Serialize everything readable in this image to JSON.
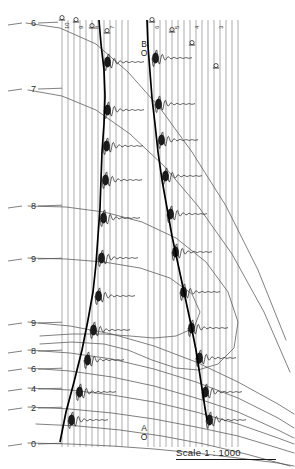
{
  "figure": {
    "kind": "seismic-refraction-record-section",
    "width": 295,
    "height": 469,
    "background": "#ffffff",
    "ink": "#1b1b1b",
    "grid_color": "#555555",
    "trace_color": "#8a8a8a"
  },
  "scale": {
    "label": "Scale",
    "value": "1 : 1000",
    "full": "Scale   1 : 1000"
  },
  "shotpoints": [
    {
      "name": "shotpoint-B",
      "letter": "B",
      "symbol": "O",
      "x": 137,
      "y": 40
    },
    {
      "name": "shotpoint-A",
      "letter": "A",
      "symbol": "O",
      "x": 137,
      "y": 424
    }
  ],
  "left_axis": {
    "name": "time-depth-axis",
    "labels": [
      {
        "text": "6",
        "y": 22,
        "leader_x2": 58
      },
      {
        "text": "7",
        "y": 88,
        "leader_x2": 62
      },
      {
        "text": "8",
        "y": 205,
        "leader_x2": 62
      },
      {
        "text": "9",
        "y": 258,
        "leader_x2": 62
      },
      {
        "text": "9",
        "y": 322,
        "leader_x2": 62
      },
      {
        "text": "8",
        "y": 350,
        "leader_x2": 62
      },
      {
        "text": "6",
        "y": 368,
        "leader_x2": 62
      },
      {
        "text": "4",
        "y": 388,
        "leader_x2": 62
      },
      {
        "text": "2",
        "y": 407,
        "leader_x2": 62
      },
      {
        "text": "0",
        "y": 443,
        "leader_x2": 62
      }
    ]
  },
  "top_labels": [
    {
      "text": "10",
      "x": 62,
      "y": 29
    },
    {
      "text": "9",
      "x": 76,
      "y": 29
    },
    {
      "text": "8",
      "x": 92,
      "y": 29
    },
    {
      "text": "7",
      "x": 107,
      "y": 29
    },
    {
      "text": "6",
      "x": 152,
      "y": 29
    },
    {
      "text": "5",
      "x": 172,
      "y": 29
    },
    {
      "text": "4",
      "x": 192,
      "y": 29
    },
    {
      "text": "3",
      "x": 216,
      "y": 29
    }
  ],
  "chart_data": {
    "type": "line",
    "title": "",
    "xlabel": "",
    "ylabel": "",
    "traces_group_left": {
      "x_positions": [
        62,
        68,
        74,
        80,
        86,
        92,
        98,
        104,
        110,
        116,
        122,
        128
      ],
      "top_y": 20,
      "bottom_y": 447
    },
    "traces_group_right": {
      "x_positions": [
        148,
        154,
        160,
        166,
        172,
        178,
        184,
        190,
        196,
        202,
        208,
        214,
        220,
        226,
        232,
        238
      ],
      "top_y": 20,
      "bottom_y": 447
    },
    "trace_top_caps": [
      {
        "x": 62,
        "y": 20
      },
      {
        "x": 76,
        "y": 22
      },
      {
        "x": 92,
        "y": 28
      },
      {
        "x": 107,
        "y": 33
      },
      {
        "x": 152,
        "y": 22
      },
      {
        "x": 172,
        "y": 32
      },
      {
        "x": 192,
        "y": 45
      },
      {
        "x": 216,
        "y": 68
      }
    ],
    "pick_curve_left": [
      [
        99,
        20
      ],
      [
        101,
        44
      ],
      [
        104,
        70
      ],
      [
        105,
        96
      ],
      [
        104,
        124
      ],
      [
        102,
        152
      ],
      [
        101,
        180
      ],
      [
        100,
        208
      ],
      [
        98,
        236
      ],
      [
        96,
        264
      ],
      [
        93,
        292
      ],
      [
        88,
        320
      ],
      [
        82,
        350
      ],
      [
        74,
        382
      ],
      [
        66,
        412
      ],
      [
        60,
        442
      ]
    ],
    "pick_curve_right": [
      [
        147,
        20
      ],
      [
        148,
        46
      ],
      [
        150,
        72
      ],
      [
        152,
        98
      ],
      [
        155,
        124
      ],
      [
        158,
        152
      ],
      [
        162,
        180
      ],
      [
        167,
        208
      ],
      [
        172,
        236
      ],
      [
        178,
        264
      ],
      [
        184,
        292
      ],
      [
        190,
        320
      ],
      [
        196,
        350
      ],
      [
        201,
        382
      ],
      [
        205,
        408
      ],
      [
        207,
        420
      ]
    ],
    "travel_time_curves": [
      {
        "name": "curve-6",
        "points": [
          [
            26,
            23
          ],
          [
            60,
            28
          ],
          [
            96,
            44
          ],
          [
            128,
            72
          ],
          [
            160,
            108
          ],
          [
            192,
            152
          ],
          [
            226,
            206
          ],
          [
            258,
            270
          ],
          [
            286,
            340
          ]
        ]
      },
      {
        "name": "curve-7",
        "points": [
          [
            28,
            90
          ],
          [
            62,
            96
          ],
          [
            96,
            110
          ],
          [
            130,
            134
          ],
          [
            164,
            166
          ],
          [
            198,
            206
          ],
          [
            232,
            254
          ],
          [
            264,
            312
          ],
          [
            290,
            372
          ]
        ]
      },
      {
        "name": "curve-8",
        "points": [
          [
            28,
            206
          ],
          [
            66,
            207
          ],
          [
            104,
            212
          ],
          [
            142,
            222
          ],
          [
            176,
            238
          ],
          [
            206,
            262
          ],
          [
            228,
            292
          ],
          [
            238,
            322
          ],
          [
            234,
            348
          ],
          [
            218,
            364
          ],
          [
            198,
            370
          ],
          [
            176,
            368
          ],
          [
            152,
            360
          ],
          [
            128,
            350
          ],
          [
            104,
            344
          ],
          [
            72,
            342
          ],
          [
            40,
            344
          ]
        ]
      },
      {
        "name": "curve-9a",
        "points": [
          [
            28,
            258
          ],
          [
            66,
            259
          ],
          [
            104,
            262
          ],
          [
            140,
            268
          ],
          [
            170,
            278
          ],
          [
            192,
            294
          ],
          [
            200,
            312
          ],
          [
            194,
            328
          ],
          [
            176,
            336
          ],
          [
            154,
            338
          ],
          [
            130,
            336
          ],
          [
            104,
            334
          ],
          [
            72,
            334
          ],
          [
            40,
            336
          ]
        ]
      },
      {
        "name": "curve-9b",
        "points": [
          [
            28,
            322
          ],
          [
            70,
            326
          ],
          [
            112,
            334
          ],
          [
            154,
            346
          ],
          [
            196,
            362
          ],
          [
            238,
            382
          ],
          [
            278,
            404
          ],
          [
            294,
            414
          ]
        ]
      },
      {
        "name": "curve-8b",
        "points": [
          [
            28,
            350
          ],
          [
            70,
            353
          ],
          [
            112,
            359
          ],
          [
            154,
            369
          ],
          [
            196,
            382
          ],
          [
            238,
            398
          ],
          [
            278,
            418
          ],
          [
            294,
            428
          ]
        ]
      },
      {
        "name": "curve-6b",
        "points": [
          [
            28,
            368
          ],
          [
            70,
            371
          ],
          [
            112,
            377
          ],
          [
            154,
            386
          ],
          [
            196,
            398
          ],
          [
            238,
            412
          ],
          [
            278,
            430
          ],
          [
            294,
            438
          ]
        ]
      },
      {
        "name": "curve-4",
        "points": [
          [
            28,
            388
          ],
          [
            70,
            390
          ],
          [
            112,
            395
          ],
          [
            154,
            402
          ],
          [
            196,
            412
          ],
          [
            238,
            424
          ],
          [
            278,
            438
          ],
          [
            294,
            444
          ]
        ]
      },
      {
        "name": "curve-2",
        "points": [
          [
            28,
            407
          ],
          [
            70,
            409
          ],
          [
            112,
            413
          ],
          [
            154,
            419
          ],
          [
            196,
            427
          ],
          [
            238,
            436
          ],
          [
            278,
            448
          ],
          [
            294,
            453
          ]
        ]
      },
      {
        "name": "curve-0",
        "points": [
          [
            28,
            443
          ],
          [
            70,
            444
          ],
          [
            112,
            446
          ],
          [
            154,
            449
          ],
          [
            196,
            453
          ],
          [
            238,
            458
          ],
          [
            278,
            463
          ],
          [
            294,
            466
          ]
        ]
      },
      {
        "name": "curve-extra-1",
        "points": [
          [
            36,
            424
          ],
          [
            78,
            426
          ],
          [
            120,
            430
          ],
          [
            162,
            436
          ],
          [
            204,
            444
          ],
          [
            246,
            454
          ],
          [
            290,
            466
          ]
        ]
      }
    ],
    "wiggle_bursts_left": [
      {
        "x": 104,
        "y": 62
      },
      {
        "x": 104,
        "y": 110
      },
      {
        "x": 103,
        "y": 146
      },
      {
        "x": 102,
        "y": 180
      },
      {
        "x": 100,
        "y": 218
      },
      {
        "x": 98,
        "y": 258
      },
      {
        "x": 95,
        "y": 296
      },
      {
        "x": 90,
        "y": 330
      },
      {
        "x": 84,
        "y": 360
      },
      {
        "x": 76,
        "y": 392
      },
      {
        "x": 68,
        "y": 420
      }
    ],
    "wiggle_bursts_right": [
      {
        "x": 152,
        "y": 58
      },
      {
        "x": 155,
        "y": 104
      },
      {
        "x": 158,
        "y": 140
      },
      {
        "x": 162,
        "y": 176
      },
      {
        "x": 167,
        "y": 214
      },
      {
        "x": 172,
        "y": 252
      },
      {
        "x": 180,
        "y": 292
      },
      {
        "x": 188,
        "y": 328
      },
      {
        "x": 196,
        "y": 358
      },
      {
        "x": 202,
        "y": 392
      },
      {
        "x": 206,
        "y": 420
      }
    ]
  }
}
